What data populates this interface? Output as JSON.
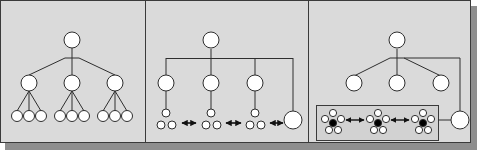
{
  "figure": {
    "colors": {
      "panel_bg": "#dcdcdc",
      "border": "#3a3a3a",
      "shadow": "#8a8a8a",
      "line": "#2e2e2e",
      "node_fill": "#ffffff",
      "hub_fill": "#000000"
    },
    "panels": [
      {
        "id": "panel-1",
        "label": "",
        "kind": "strict-tree",
        "levels": 3,
        "children_per_node": 3
      },
      {
        "id": "panel-2",
        "label": "",
        "kind": "tree-with-peer-links",
        "levels": 3,
        "peer_arrows": 3
      },
      {
        "id": "panel-3",
        "label": "",
        "kind": "tree-with-clustered-network",
        "clusters": 3,
        "peer_arrows": 2
      }
    ]
  }
}
